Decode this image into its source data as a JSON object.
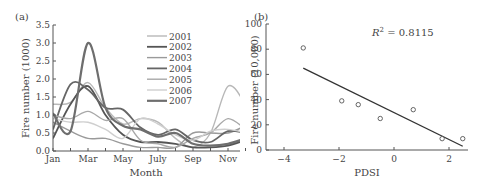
{
  "chart_data": [
    {
      "panel": "(a)",
      "type": "line",
      "title": "",
      "xlabel": "Month",
      "ylabel": "Fire number (1000)",
      "ylim": [
        0,
        3.5
      ],
      "yticks": [
        "0.0",
        "0.5",
        "1.0",
        "1.5",
        "2.0",
        "2.5",
        "3.0",
        "3.5"
      ],
      "xticks": [
        "Jan",
        "Mar",
        "May",
        "July",
        "Sep",
        "Nov"
      ],
      "x": [
        1,
        2,
        3,
        4,
        5,
        6,
        7,
        8,
        9,
        10,
        11,
        12
      ],
      "grid": false,
      "legend_position": "upper right",
      "series": [
        {
          "name": "2001",
          "color": "#b8b8b8",
          "width": 1.4,
          "values": [
            1.3,
            1.35,
            1.9,
            1.2,
            0.75,
            0.9,
            0.8,
            0.35,
            0.1,
            0.5,
            1.8,
            1.3
          ]
        },
        {
          "name": "2002",
          "color": "#555555",
          "width": 1.8,
          "values": [
            0.35,
            1.3,
            1.8,
            1.0,
            0.45,
            0.25,
            0.25,
            0.2,
            0.1,
            0.1,
            0.15,
            0.3
          ]
        },
        {
          "name": "2003",
          "color": "#9a9a9a",
          "width": 1.4,
          "values": [
            0.8,
            0.55,
            0.35,
            0.35,
            0.2,
            0.1,
            0.1,
            0.1,
            0.5,
            0.5,
            0.5,
            0.7
          ]
        },
        {
          "name": "2004",
          "color": "#666666",
          "width": 1.8,
          "values": [
            0.6,
            1.85,
            1.7,
            1.2,
            1.15,
            0.65,
            0.45,
            0.6,
            0.3,
            0.25,
            0.55,
            0.5
          ]
        },
        {
          "name": "2005",
          "color": "#a8a8a8",
          "width": 1.4,
          "values": [
            1.0,
            0.9,
            1.1,
            0.85,
            0.9,
            0.3,
            0.2,
            0.1,
            0.35,
            0.5,
            0.9,
            0.6
          ]
        },
        {
          "name": "2006",
          "color": "#cfcfcf",
          "width": 1.4,
          "values": [
            0.9,
            0.8,
            0.8,
            0.6,
            0.35,
            0.9,
            0.75,
            0.45,
            0.3,
            0.55,
            0.6,
            0.5
          ]
        },
        {
          "name": "2007",
          "color": "#6e6e6e",
          "width": 2.2,
          "values": [
            1.05,
            0.55,
            3.0,
            1.2,
            0.7,
            0.6,
            0.4,
            0.5,
            0.2,
            0.15,
            0.2,
            0.35
          ]
        }
      ]
    },
    {
      "panel": "(b)",
      "type": "scatter",
      "title": "",
      "xlabel": "PDSI",
      "ylabel": "Fire number (10,000)",
      "xlim": [
        -4,
        2.6
      ],
      "ylim": [
        0,
        100
      ],
      "xticks": [
        "−4",
        "−2",
        "0",
        "2"
      ],
      "yticks": [
        "0",
        "20",
        "40",
        "60",
        "80",
        "100"
      ],
      "annotation": "R² = 0.8115",
      "annotation_base": "R",
      "annotation_sup": "2",
      "annotation_rest": " = 0.8115",
      "grid": false,
      "points": [
        {
          "x": -3.3,
          "y": 81
        },
        {
          "x": -1.9,
          "y": 39
        },
        {
          "x": -1.3,
          "y": 36
        },
        {
          "x": -0.5,
          "y": 25
        },
        {
          "x": 0.7,
          "y": 32
        },
        {
          "x": 1.75,
          "y": 9
        },
        {
          "x": 2.5,
          "y": 9
        }
      ],
      "trendline": {
        "x1": -3.3,
        "y1": 65,
        "x2": 2.5,
        "y2": 3
      }
    }
  ]
}
